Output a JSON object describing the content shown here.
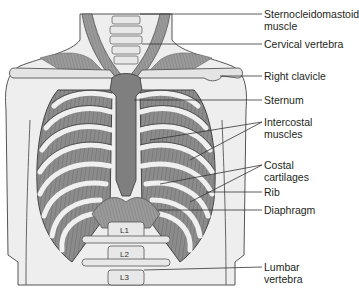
{
  "figure": {
    "colors": {
      "background": "#ffffff",
      "skin": "#ededed",
      "skin_outline": "#555555",
      "muscle": "#8a8a8a",
      "muscle_stripe": "#6e6e6e",
      "bone": "#e6e6e6",
      "sternum": "#7f7f7f",
      "leader_line": "#333333",
      "text": "#231f20"
    },
    "labels": [
      {
        "id": "sternocleidomastoid",
        "line1": "Sternocleidomastoid",
        "line2": "muscle",
        "y": 8
      },
      {
        "id": "cervical-vertebra",
        "line1": "Cervical vertebra",
        "line2": "",
        "y": 37
      },
      {
        "id": "right-clavicle",
        "line1": "Right clavicle",
        "line2": "",
        "y": 68
      },
      {
        "id": "sternum",
        "line1": "Sternum",
        "line2": "",
        "y": 93
      },
      {
        "id": "intercostal-muscles",
        "line1": "Intercostal",
        "line2": "muscles",
        "y": 115
      },
      {
        "id": "costal-cartilages",
        "line1": "Costal",
        "line2": "cartilages",
        "y": 158
      },
      {
        "id": "rib",
        "line1": "Rib",
        "line2": "",
        "y": 186
      },
      {
        "id": "diaphragm",
        "line1": "Diaphragm",
        "line2": "",
        "y": 204
      },
      {
        "id": "lumbar-vertebra",
        "line1": "Lumbar",
        "line2": "vertebra",
        "y": 261
      }
    ],
    "vertebra_labels": [
      "L1",
      "L2",
      "L3"
    ]
  }
}
